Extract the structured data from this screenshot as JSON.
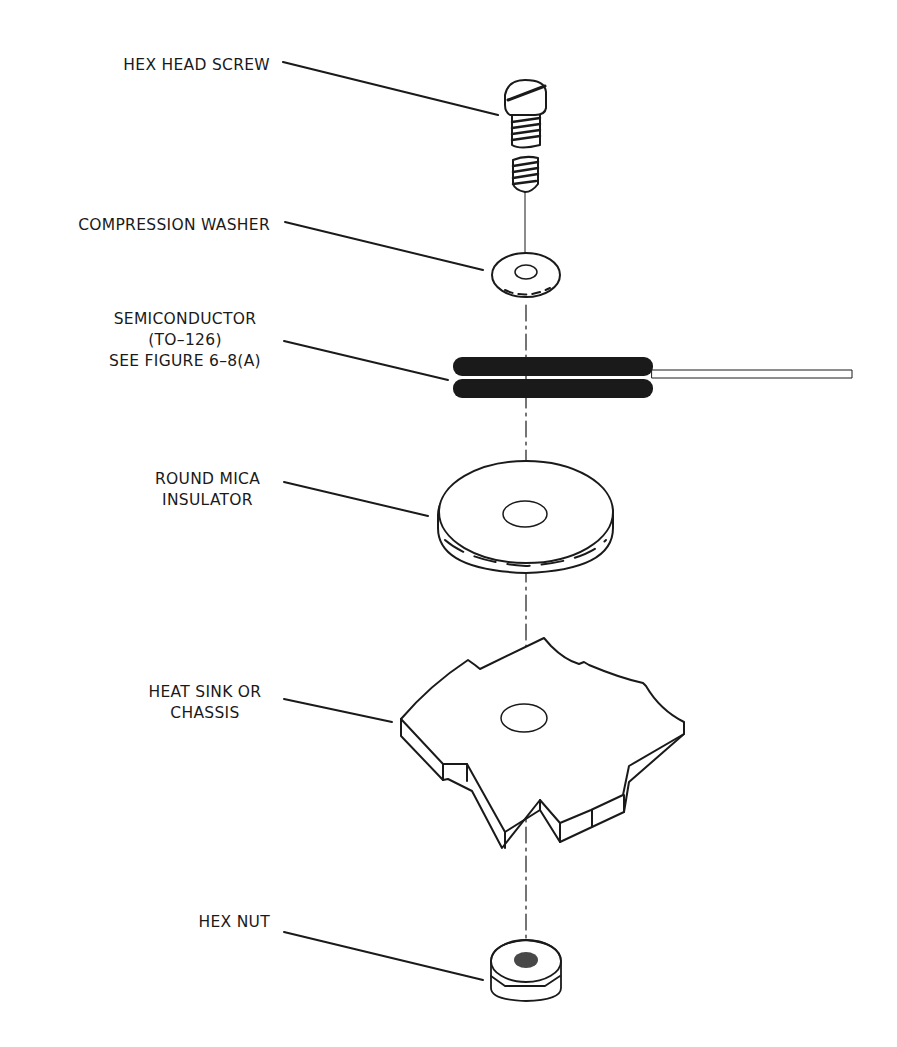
{
  "figure": {
    "labels": [
      {
        "id": "hex-head-screw",
        "lines": [
          "HEX HEAD SCREW"
        ]
      },
      {
        "id": "compression-washer",
        "lines": [
          "COMPRESSION WASHER"
        ]
      },
      {
        "id": "semiconductor",
        "lines": [
          "SEMICONDUCTOR",
          "(TO–126)",
          "SEE FIGURE 6–8(A)"
        ]
      },
      {
        "id": "round-mica-insulator",
        "lines": [
          "ROUND MICA",
          "INSULATOR"
        ]
      },
      {
        "id": "heat-sink",
        "lines": [
          "HEAT SINK OR",
          "CHASSIS"
        ]
      },
      {
        "id": "hex-nut",
        "lines": [
          "HEX NUT"
        ]
      }
    ],
    "colors": {
      "ink": "#1a1a1a",
      "background": "#ffffff"
    }
  }
}
